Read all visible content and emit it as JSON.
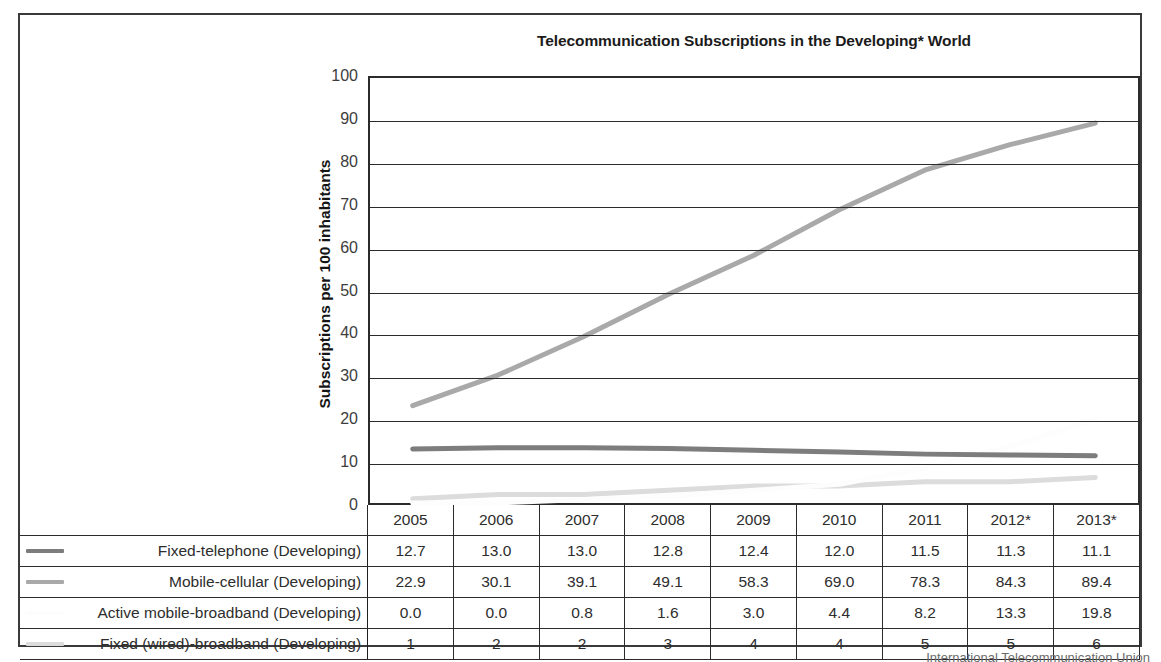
{
  "chart_data": {
    "type": "line",
    "title": "Telecommunication Subscriptions in the Developing* World",
    "xlabel": "",
    "ylabel": "Subscriptions per 100 inhabitants",
    "ylim": [
      0,
      100
    ],
    "ytick_step": 10,
    "yticks": [
      "100",
      "90",
      "80",
      "70",
      "60",
      "50",
      "40",
      "30",
      "20",
      "10",
      "0"
    ],
    "grid": true,
    "legend_position": "table-left",
    "categories": [
      "2005",
      "2006",
      "2007",
      "2008",
      "2009",
      "2010",
      "2011",
      "2012*",
      "2013*"
    ],
    "series": [
      {
        "name": "Fixed-telephone (Developing)",
        "color": "#7d7d7d",
        "values": [
          12.7,
          13.0,
          13.0,
          12.8,
          12.4,
          12.0,
          11.5,
          11.3,
          11.1
        ],
        "display": [
          "12.7",
          "13.0",
          "13.0",
          "12.8",
          "12.4",
          "12.0",
          "11.5",
          "11.3",
          "11.1"
        ]
      },
      {
        "name": "Mobile-cellular (Developing)",
        "color": "#a9a9a9",
        "values": [
          22.9,
          30.1,
          39.1,
          49.1,
          58.3,
          69.0,
          78.3,
          84.3,
          89.4
        ],
        "display": [
          "22.9",
          "30.1",
          "39.1",
          "49.1",
          "58.3",
          "69.0",
          "78.3",
          "84.3",
          "89.4"
        ]
      },
      {
        "name": "Active mobile-broadband (Developing)",
        "color": "#fdfdfd",
        "values": [
          0.0,
          0.0,
          0.8,
          1.6,
          3.0,
          4.4,
          8.2,
          13.3,
          19.8
        ],
        "display": [
          "0.0",
          "0.0",
          "0.8",
          "1.6",
          "3.0",
          "4.4",
          "8.2",
          "13.3",
          "19.8"
        ]
      },
      {
        "name": "Fixed (wired)-broadband (Developing)",
        "color": "#dcdcdc",
        "values": [
          1,
          2,
          2,
          3,
          4,
          4,
          5,
          5,
          6
        ],
        "display": [
          "1",
          "2",
          "2",
          "3",
          "4",
          "4",
          "5",
          "5",
          "6"
        ]
      }
    ]
  },
  "footnote": "International Telecommunication Union"
}
